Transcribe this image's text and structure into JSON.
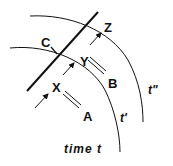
{
  "diagram": {
    "points": {
      "A": "A",
      "B": "B",
      "C": "C",
      "X": "X",
      "Y": "Y",
      "Z": "Z"
    },
    "time_labels": {
      "t0": "time t",
      "t1": "t'",
      "t2": "t\""
    },
    "colors": {
      "ink": "#111111",
      "background": "#ffffff"
    }
  }
}
